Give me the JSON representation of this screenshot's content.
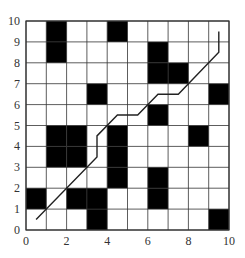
{
  "chart_data": {
    "type": "heatmap",
    "title": "",
    "xlabel": "",
    "ylabel": "",
    "xlim": [
      0,
      10
    ],
    "ylim": [
      0,
      10
    ],
    "grid": true,
    "x_ticks": [
      "0",
      "2",
      "4",
      "6",
      "8",
      "10"
    ],
    "y_ticks": [
      "0",
      "1",
      "2",
      "3",
      "4",
      "5",
      "6",
      "7",
      "8",
      "9",
      "10"
    ],
    "obstacles": [
      {
        "col": 1,
        "row": 9
      },
      {
        "col": 4,
        "row": 9
      },
      {
        "col": 1,
        "row": 8
      },
      {
        "col": 6,
        "row": 8
      },
      {
        "col": 6,
        "row": 7
      },
      {
        "col": 7,
        "row": 7
      },
      {
        "col": 3,
        "row": 6
      },
      {
        "col": 9,
        "row": 6
      },
      {
        "col": 6,
        "row": 5
      },
      {
        "col": 1,
        "row": 4
      },
      {
        "col": 2,
        "row": 4
      },
      {
        "col": 4,
        "row": 4
      },
      {
        "col": 8,
        "row": 4
      },
      {
        "col": 1,
        "row": 3
      },
      {
        "col": 2,
        "row": 3
      },
      {
        "col": 4,
        "row": 3
      },
      {
        "col": 4,
        "row": 2
      },
      {
        "col": 6,
        "row": 2
      },
      {
        "col": 0,
        "row": 1
      },
      {
        "col": 2,
        "row": 1
      },
      {
        "col": 3,
        "row": 1
      },
      {
        "col": 6,
        "row": 1
      },
      {
        "col": 3,
        "row": 0
      },
      {
        "col": 9,
        "row": 0
      }
    ],
    "path": [
      [
        0.5,
        0.5
      ],
      [
        3.5,
        3.5
      ],
      [
        3.5,
        4.5
      ],
      [
        4.5,
        5.5
      ],
      [
        5.5,
        5.5
      ],
      [
        6.5,
        6.5
      ],
      [
        7.5,
        6.5
      ],
      [
        9.5,
        8.5
      ],
      [
        9.5,
        9.5
      ]
    ],
    "colors": {
      "obstacle": "#000000",
      "free": "#ffffff",
      "grid_line": "#333333",
      "path": "#222222"
    }
  }
}
